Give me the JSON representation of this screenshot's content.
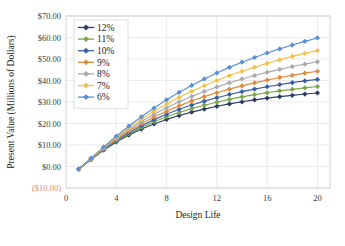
{
  "chart_data": {
    "type": "line",
    "title": "",
    "xlabel": "Design Life",
    "ylabel": "Present Value (Millions of Dollars)",
    "xlim": [
      0,
      21
    ],
    "ylim": [
      -10,
      70
    ],
    "xticks": [
      "0",
      "4",
      "8",
      "12",
      "16",
      "20"
    ],
    "xtick_values": [
      0,
      4,
      8,
      12,
      16,
      20
    ],
    "yticks": [
      "($10.00)",
      "$0.00",
      "$10.00",
      "$20.00",
      "$30.00",
      "$40.00",
      "$50.00",
      "$60.00",
      "$70.00"
    ],
    "ytick_values": [
      -10,
      0,
      10,
      20,
      30,
      40,
      50,
      60,
      70
    ],
    "negative_tick_label": "($10.00)",
    "negative_tick_color": "#e8836b",
    "grid": true,
    "legend_position": "upper-left-inside",
    "marker": "diamond",
    "x": [
      1,
      2,
      3,
      4,
      5,
      6,
      7,
      8,
      9,
      10,
      11,
      12,
      13,
      14,
      15,
      16,
      17,
      18,
      19,
      20
    ],
    "series": [
      {
        "name": "12%",
        "label": "12%",
        "color": "#2b3d63",
        "values": [
          -1.3,
          3.2,
          7.6,
          11.4,
          14.6,
          17.4,
          19.8,
          21.9,
          23.7,
          25.3,
          26.7,
          28.0,
          29.1,
          30.1,
          31.0,
          31.8,
          32.5,
          33.1,
          33.7,
          34.2
        ]
      },
      {
        "name": "11%",
        "label": "11%",
        "color": "#7aa64c",
        "values": [
          -1.3,
          3.3,
          7.8,
          11.8,
          15.2,
          18.2,
          20.8,
          23.1,
          25.1,
          26.9,
          28.5,
          29.9,
          31.2,
          32.4,
          33.4,
          34.3,
          35.2,
          35.9,
          36.6,
          37.2
        ]
      },
      {
        "name": "10%",
        "label": "10%",
        "color": "#3b5ea8",
        "values": [
          -1.3,
          3.4,
          8.0,
          12.2,
          15.8,
          19.0,
          21.8,
          24.3,
          26.6,
          28.6,
          30.4,
          32.0,
          33.5,
          34.8,
          36.0,
          37.1,
          38.1,
          39.0,
          39.8,
          40.5
        ]
      },
      {
        "name": "9%",
        "label": "9%",
        "color": "#e08b3c",
        "values": [
          -1.2,
          3.5,
          8.3,
          12.6,
          16.5,
          19.9,
          23.0,
          25.7,
          28.2,
          30.5,
          32.5,
          34.3,
          36.0,
          37.5,
          38.9,
          40.2,
          41.4,
          42.4,
          43.4,
          44.3
        ]
      },
      {
        "name": "8%",
        "label": "8%",
        "color": "#a8aaad",
        "values": [
          -1.2,
          3.6,
          8.5,
          13.1,
          17.2,
          20.9,
          24.3,
          27.3,
          30.1,
          32.6,
          34.9,
          37.0,
          38.9,
          40.7,
          42.3,
          43.8,
          45.2,
          46.5,
          47.6,
          48.7
        ]
      },
      {
        "name": "7%",
        "label": "7%",
        "color": "#f0c24b",
        "values": [
          -1.2,
          3.8,
          8.8,
          13.6,
          18.0,
          22.0,
          25.7,
          29.1,
          32.2,
          35.0,
          37.6,
          40.0,
          42.3,
          44.3,
          46.2,
          48.0,
          49.6,
          51.2,
          52.6,
          53.9
        ]
      },
      {
        "name": "6%",
        "label": "6%",
        "color": "#5b8fd4",
        "values": [
          -1.1,
          3.9,
          9.1,
          14.1,
          18.8,
          23.1,
          27.2,
          31.0,
          34.5,
          37.7,
          40.7,
          43.5,
          46.1,
          48.5,
          50.7,
          52.8,
          54.7,
          56.5,
          58.2,
          59.8
        ]
      }
    ]
  },
  "legend": {
    "entries": [
      "12%",
      "11%",
      "10%",
      "9%",
      "8%",
      "7%",
      "6%"
    ]
  }
}
